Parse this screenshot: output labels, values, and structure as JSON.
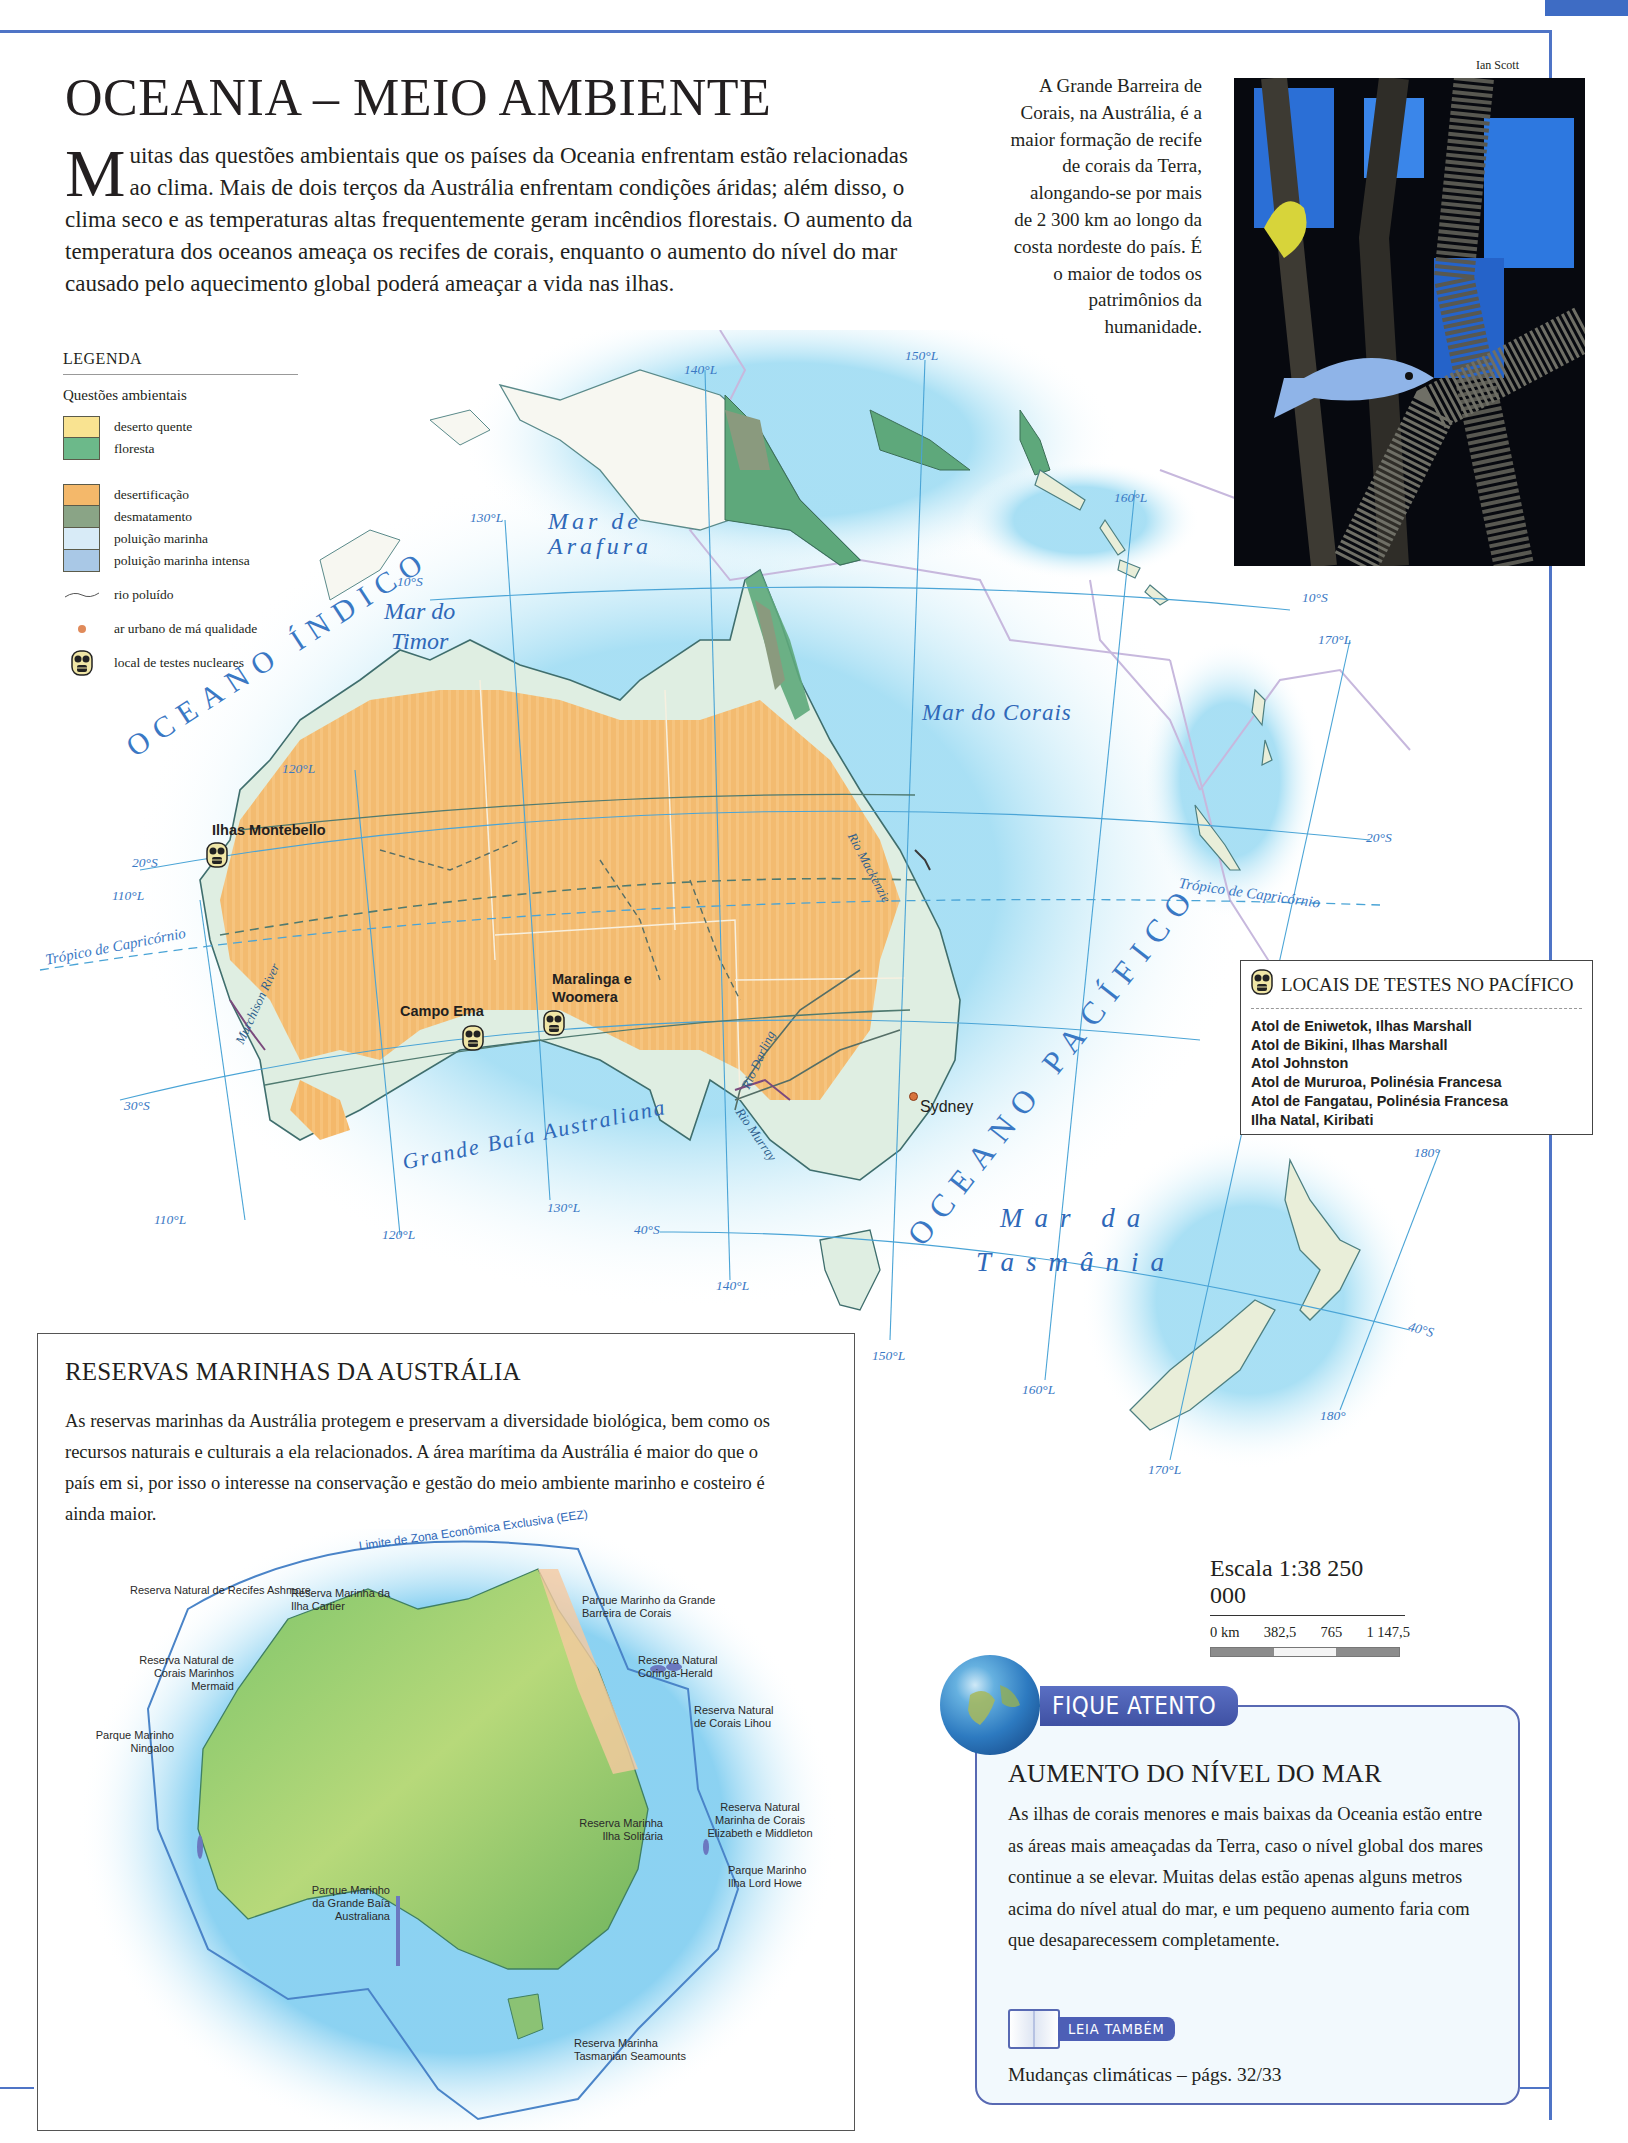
{
  "page": {
    "title": "OCEANIA – MEIO AMBIENTE",
    "intro_drop": "M",
    "intro": "uitas das questões ambientais que os países da Oceania enfrentam estão relacionadas ao clima. Mais de dois terços da Austrália enfrentam condições áridas; além disso, o clima seco e as temperaturas altas frequentemente geram incêndios florestais. O aumento da temperatura dos oceanos ameaça os recifes de corais, enquanto o aumento do nível do mar causado pelo aquecimento global poderá ameaçar a vida nas ilhas.",
    "colors": {
      "frame": "#4f74c6",
      "desert": "#f5b968",
      "forest": "#5ea87b",
      "ocean_label": "#2f68b8",
      "sea": "#bde6f5"
    }
  },
  "photo": {
    "credit": "Ian Scott",
    "caption": "A Grande Barreira de Corais, na Austrália, é a maior formação de recife de corais da Terra, alongando-se por mais de 2 300 km ao longo da costa nordeste do país. É o maior de todos os patrimônios da humanidade."
  },
  "legend": {
    "title": "LEGENDA",
    "subtitle": "Questões ambientais",
    "group1": [
      {
        "label": "deserto quente",
        "color": "#f9e391"
      },
      {
        "label": "floresta",
        "color": "#6cb98a"
      }
    ],
    "group2": [
      {
        "label": "desertificação",
        "color": "#f4b86a"
      },
      {
        "label": "desmatamento",
        "color": "#8aa486"
      },
      {
        "label": "poluição marinha",
        "color": "#d8ebf7"
      },
      {
        "label": "poluição marinha intensa",
        "color": "#a9c8e6"
      }
    ],
    "river": "rio poluído",
    "urban_air": "ar urbano de má qualidade",
    "nuclear": "local de testes nucleares"
  },
  "map": {
    "seas": {
      "arafura_1": "Mar de",
      "arafura_2": "Arafura",
      "timor_1": "Mar do",
      "timor_2": "Timor",
      "corais": "Mar do Corais",
      "tasmania_1": "Mar da",
      "tasmania_2": "Tasmânia",
      "indico": "OCEANO ÍNDICO",
      "pacifico": "OCEANO PACÍFICO",
      "baia": "Grande Baía Australiana"
    },
    "rivers": [
      "Rio Mackenzie",
      "Rio Darling",
      "Rio Murray",
      "Murchison River"
    ],
    "tropic": "Trópico de Capricórnio",
    "coords": {
      "lon_110": "110°L",
      "lon_120": "120°L",
      "lon_130": "130°L",
      "lon_140": "140°L",
      "lon_150": "150°L",
      "lon_160": "160°L",
      "lon_170": "170°L",
      "lon_180": "180°",
      "lat_10": "10°S",
      "lat_20": "20°S",
      "lat_30": "30°S",
      "lat_40": "40°S"
    },
    "sites": {
      "montebello": "Ilhas Montebello",
      "campo_ema": "Campo Ema",
      "maralinga_1": "Maralinga e",
      "maralinga_2": "Woomera",
      "sydney": "Sydney"
    }
  },
  "pacific_tests": {
    "title": "LOCAIS DE TESTES NO PACÍFICO",
    "items": [
      "Atol de Eniwetok, Ilhas Marshall",
      "Atol de Bikini, Ilhas Marshall",
      "Atol Johnston",
      "Atol de Mururoa, Polinésia Francesa",
      "Atol de Fangatau, Polinésia Francesa",
      "Ilha Natal, Kiribati"
    ]
  },
  "reserves": {
    "title": "RESERVAS MARINHAS DA AUSTRÁLIA",
    "text": "As reservas marinhas da Austrália protegem e preservam a diversidade biológica, bem como os recursos naturais e culturais a ela relacionados. A área marítima da Austrália é maior do que o país em si, por isso o interesse na conservação e gestão do meio ambiente marinho e costeiro é ainda maior.",
    "eez_label": "Limite de Zona Econômica Exclusiva (EEZ)",
    "labels": [
      "Reserva Natural de Recifes Ashmore",
      "Reserva Marinha da Ilha Cartier",
      "Reserva Natural de Corais Marinhos Mermaid",
      "Parque Marinho Ningaloo",
      "Parque Marinho da Grande Barreira de Corais",
      "Reserva Natural Coringa-Herald",
      "Reserva Natural de Corais Lihou",
      "Reserva Marinha Ilha Solitária",
      "Reserva Natural Marinha de Corais Elizabeth e Middleton",
      "Parque Marinho Ilha Lord Howe",
      "Parque Marinho da Grande Baía Australiana",
      "Reserva Marinha Tasmanian Seamounts"
    ],
    "legend": {
      "title": "LEGENDA",
      "park": "parque marinho",
      "reserve": "reserva marinha",
      "eez": "limite de zona econômica exclusiva",
      "park_color": "#f6c9a0",
      "reserve_color": "#6b78c0"
    }
  },
  "scale": {
    "title": "Escala 1:38 250 000",
    "ticks": [
      "0 km",
      "382,5",
      "765",
      "1 147,5"
    ]
  },
  "fique_atento": {
    "tab": "FIQUE ATENTO",
    "title": "AUMENTO DO NÍVEL DO MAR",
    "text": "As ilhas de corais menores e mais baixas da Oceania estão entre as áreas mais ameaçadas da Terra, caso o nível global dos mares continue a se elevar. Muitas delas estão apenas alguns metros acima do nível atual do mar, e um pequeno aumento faria com que desaparecessem completamente.",
    "leia": "LEIA TAMBÉM",
    "ref": "Mudanças climáticas – págs. 32/33"
  }
}
